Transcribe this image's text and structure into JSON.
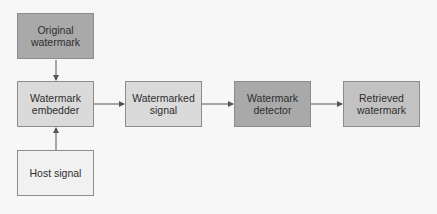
{
  "diagram": {
    "nodes": [
      {
        "id": "original-watermark",
        "label": "Original\nwatermark",
        "fill": "#a9a9a9"
      },
      {
        "id": "watermark-embedder",
        "label": "Watermark\nembedder",
        "fill": "#dadada"
      },
      {
        "id": "host-signal",
        "label": "Host signal",
        "fill": "#f1f1f1"
      },
      {
        "id": "watermarked-signal",
        "label": "Watermarked\nsignal",
        "fill": "#dadada"
      },
      {
        "id": "watermark-detector",
        "label": "Watermark\ndetector",
        "fill": "#a9a9a9"
      },
      {
        "id": "retrieved-watermark",
        "label": "Retrieved\nwatermark",
        "fill": "#c2c2c2"
      }
    ],
    "edges": [
      {
        "from": "original-watermark",
        "to": "watermark-embedder"
      },
      {
        "from": "host-signal",
        "to": "watermark-embedder"
      },
      {
        "from": "watermark-embedder",
        "to": "watermarked-signal"
      },
      {
        "from": "watermarked-signal",
        "to": "watermark-detector"
      },
      {
        "from": "watermark-detector",
        "to": "retrieved-watermark"
      }
    ],
    "edge_color": "#555555"
  }
}
